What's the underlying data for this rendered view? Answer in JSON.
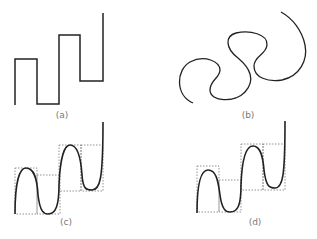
{
  "figure": {
    "panels": [
      {
        "id": "a",
        "label": "(a)",
        "description": "rectilinear step curve"
      },
      {
        "id": "b",
        "label": "(b)",
        "description": "smooth rotated s-curves"
      },
      {
        "id": "c",
        "label": "(c)",
        "description": "smooth curve with dotted bounding boxes"
      },
      {
        "id": "d",
        "label": "(d)",
        "description": "smooth curve with dotted bounding boxes"
      }
    ],
    "colors": {
      "stroke": "#222222",
      "box": "#777777",
      "label": "#777777"
    }
  }
}
